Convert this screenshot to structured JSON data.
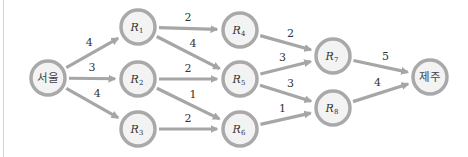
{
  "diagram": {
    "type": "weighted-directed-graph",
    "nodes": [
      {
        "id": "seoul",
        "label": "서울",
        "x": 48,
        "y": 78
      },
      {
        "id": "R1",
        "label": "R",
        "sub": "1",
        "x": 138,
        "y": 27
      },
      {
        "id": "R2",
        "label": "R",
        "sub": "2",
        "x": 138,
        "y": 79
      },
      {
        "id": "R3",
        "label": "R",
        "sub": "3",
        "x": 138,
        "y": 129
      },
      {
        "id": "R4",
        "label": "R",
        "sub": "4",
        "x": 240,
        "y": 30
      },
      {
        "id": "R5",
        "label": "R",
        "sub": "5",
        "x": 240,
        "y": 79
      },
      {
        "id": "R6",
        "label": "R",
        "sub": "6",
        "x": 240,
        "y": 129
      },
      {
        "id": "R7",
        "label": "R",
        "sub": "7",
        "x": 333,
        "y": 56
      },
      {
        "id": "R8",
        "label": "R",
        "sub": "8",
        "x": 333,
        "y": 108
      },
      {
        "id": "jeju",
        "label": "제주",
        "x": 430,
        "y": 77
      }
    ],
    "edges": [
      {
        "from": "seoul",
        "to": "R1",
        "weight": "4"
      },
      {
        "from": "seoul",
        "to": "R2",
        "weight": "3"
      },
      {
        "from": "seoul",
        "to": "R3",
        "weight": "4"
      },
      {
        "from": "R1",
        "to": "R4",
        "weight": "2"
      },
      {
        "from": "R1",
        "to": "R5",
        "weight": "4"
      },
      {
        "from": "R2",
        "to": "R5",
        "weight": "2"
      },
      {
        "from": "R2",
        "to": "R6",
        "weight": "1"
      },
      {
        "from": "R3",
        "to": "R6",
        "weight": "2"
      },
      {
        "from": "R4",
        "to": "R7",
        "weight": "2"
      },
      {
        "from": "R5",
        "to": "R7",
        "weight": "3"
      },
      {
        "from": "R5",
        "to": "R8",
        "weight": "3"
      },
      {
        "from": "R6",
        "to": "R8",
        "weight": "1"
      },
      {
        "from": "R7",
        "to": "jeju",
        "weight": "5"
      },
      {
        "from": "R8",
        "to": "jeju",
        "weight": "4"
      }
    ],
    "colors": {
      "edge": "#a6a6a6",
      "node_stroke": "#a9a9a9",
      "node_fill": "#f3f3f3",
      "text": "#333333"
    }
  }
}
